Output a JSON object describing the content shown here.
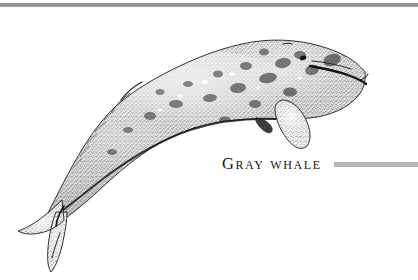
{
  "page": {
    "background_color": "#ffffff",
    "width": 418,
    "height": 280
  },
  "top_rule": {
    "name": "top-divider-rule",
    "color": "#8d8d8d"
  },
  "illustration": {
    "subject": "gray whale",
    "style": "black-and-white stipple pen-and-ink engraving",
    "orientation": "head upper right, tail lower left, body diagonal",
    "ink_color": "#1a1a1a",
    "parts": [
      "head",
      "rostrum",
      "mouth-line",
      "eye",
      "body",
      "dorsal-hump",
      "knuckle-ridge",
      "pectoral-flipper",
      "ventral-nub",
      "tail-stock",
      "tail-fluke"
    ]
  },
  "caption": {
    "text": "Gray whale",
    "color": "#141414",
    "rule_color": "#b6b6b6"
  }
}
